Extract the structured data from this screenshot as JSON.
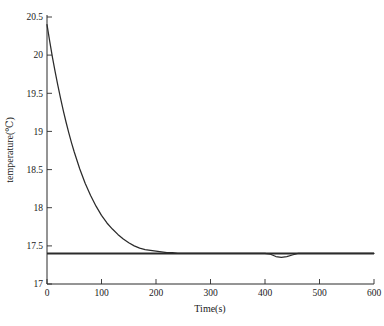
{
  "chart_data": {
    "type": "line",
    "title": "",
    "xlabel": "Time(s)",
    "ylabel": "temperature(℃)",
    "xlim": [
      0,
      600
    ],
    "ylim": [
      17,
      20.5
    ],
    "xticks": [
      0,
      100,
      200,
      300,
      400,
      500,
      600
    ],
    "xtick_labels": [
      "0",
      "100",
      "200",
      "300",
      "400",
      "500",
      "600"
    ],
    "yticks": [
      17,
      17.5,
      18,
      18.5,
      19,
      19.5,
      20,
      20.5
    ],
    "ytick_labels": [
      "17",
      "17.5",
      "18",
      "18.5",
      "19",
      "19.5",
      "20",
      "20.5"
    ],
    "grid": false,
    "legend": null,
    "series": [
      {
        "name": "temperature",
        "color": "#2b2b2b",
        "x": [
          0,
          5,
          10,
          15,
          20,
          25,
          30,
          35,
          40,
          45,
          50,
          60,
          70,
          80,
          90,
          100,
          110,
          120,
          130,
          140,
          150,
          160,
          170,
          180,
          190,
          200,
          210,
          220,
          230,
          240,
          250,
          260,
          270,
          280,
          290,
          300,
          320,
          340,
          360,
          380,
          400,
          410,
          420,
          430,
          440,
          450,
          460,
          470,
          480,
          500,
          520,
          540,
          560,
          580,
          600
        ],
        "y": [
          20.4,
          20.18,
          19.97,
          19.78,
          19.6,
          19.43,
          19.27,
          19.12,
          18.98,
          18.85,
          18.73,
          18.51,
          18.32,
          18.16,
          18.02,
          17.9,
          17.8,
          17.72,
          17.65,
          17.59,
          17.54,
          17.5,
          17.47,
          17.45,
          17.44,
          17.43,
          17.42,
          17.41,
          17.41,
          17.4,
          17.4,
          17.4,
          17.4,
          17.4,
          17.4,
          17.4,
          17.4,
          17.4,
          17.4,
          17.4,
          17.4,
          17.39,
          17.36,
          17.35,
          17.36,
          17.38,
          17.4,
          17.4,
          17.4,
          17.4,
          17.4,
          17.4,
          17.4,
          17.4,
          17.4
        ]
      },
      {
        "name": "steady-state reference",
        "color": "#2b2b2b",
        "type": "hline",
        "value": 17.4
      }
    ],
    "annotations": {
      "initial_temperature": 20.4,
      "steady_state_temperature": 17.4,
      "time_constant_s": 65
    }
  },
  "axes": {
    "x_axis_name": "Time(s)",
    "y_axis_name": "temperature(℃)"
  }
}
